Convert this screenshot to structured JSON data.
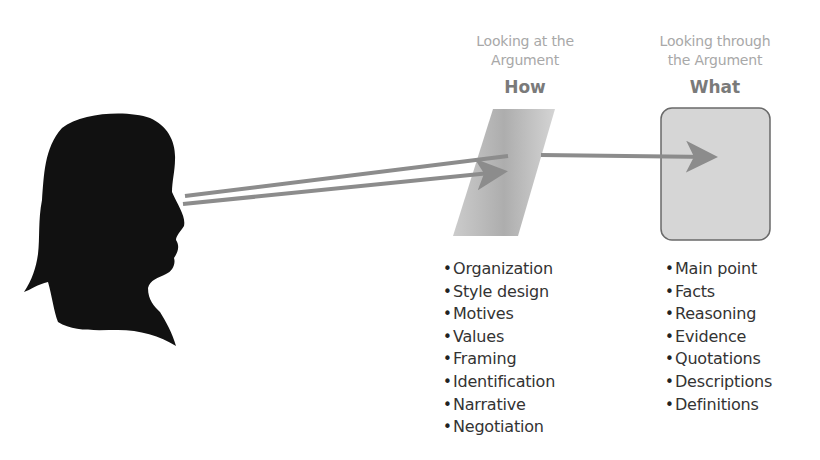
{
  "colors": {
    "silhouette": "#111111",
    "arrow": "#8c8c8c",
    "lens_fill": "#b5b5b5",
    "box_fill": "#d6d6d6",
    "box_border": "#6a6a6a",
    "caption_text": "#a8a8a8",
    "heading_text": "#7a7a7a",
    "list_text": "#333333"
  },
  "icons": {
    "viewer": "person-silhouette-icon",
    "lens": "glass-pane-icon",
    "target": "content-box-icon"
  },
  "how": {
    "caption_line1": "Looking at the",
    "caption_line2": "Argument",
    "heading": "How",
    "items": [
      "Organization",
      "Style design",
      "Motives",
      "Values",
      "Framing",
      "Identification",
      "Narrative",
      "Negotiation"
    ]
  },
  "what": {
    "caption_line1": "Looking through",
    "caption_line2": "the Argument",
    "heading": "What",
    "items": [
      "Main point",
      "Facts",
      "Reasoning",
      "Evidence",
      "Quotations",
      "Descriptions",
      "Definitions"
    ]
  }
}
